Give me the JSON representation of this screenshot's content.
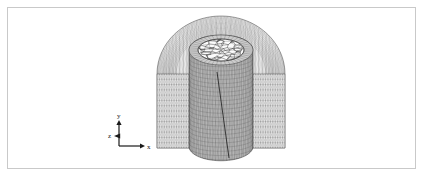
{
  "figure": {
    "kind": "finite-element-mesh-view",
    "caption": "",
    "background_color": "#ffffff",
    "border_color": "#c9c9c9",
    "mesh_line_color": "#4a4a4a",
    "mesh_fill_color": "#b4b4b4",
    "outline_color": "#222222"
  },
  "axis_triad": {
    "name": "coordinate-triad",
    "origin_x": 119,
    "origin_y": 146,
    "labels": {
      "x": "x",
      "y": "y",
      "z": "z"
    },
    "x_axis_length": 22,
    "y_axis_length": 22,
    "z_axis_marker": "out-of-plane",
    "color": "#1a1a1a"
  },
  "model": {
    "name": "cylindrical-inclusion-in-domed-domain",
    "outer_domain": {
      "name": "outer-dome-mesh",
      "center_x": 221,
      "top_y": 16,
      "base_y": 148,
      "half_width": 64,
      "dome_height": 58,
      "circumferential_divisions": 40,
      "radial_divisions": 14,
      "vertical_divisions": 22
    },
    "cut_planes": {
      "name": "quarter-cut-faces",
      "left_face_x_range": [
        157,
        196
      ],
      "right_face_x_range": [
        246,
        285
      ],
      "face_top_y": 74,
      "face_bottom_y": 148,
      "grid_columns": 16,
      "grid_rows": 14
    },
    "inner_cylinder": {
      "name": "inner-cylinder-mesh",
      "center_x": 221,
      "top_y": 50,
      "bottom_y": 160,
      "radius_x": 32,
      "cap_radius_y": 15,
      "circumferential_divisions": 36,
      "vertical_divisions": 26,
      "bottom_rounded": true
    },
    "cap_disc": {
      "name": "cylinder-top-cap",
      "center_x": 221,
      "center_y": 63,
      "radius_x": 23,
      "radius_y": 11,
      "mesh_type": "unstructured-triangular",
      "node_count": 96
    },
    "seam": {
      "name": "cut-seam-line",
      "from_x": 217,
      "from_y": 72,
      "to_x": 229,
      "to_y": 158
    }
  }
}
